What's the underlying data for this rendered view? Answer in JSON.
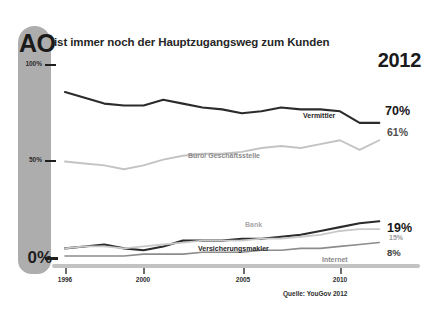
{
  "header": {
    "brand_mark": "AO",
    "headline": "ist immer noch der Hauptzugangsweg zum Kunden",
    "year": "2012"
  },
  "source": {
    "note": "Quelle: YouGov 2012"
  },
  "axis": {
    "y_labels": {
      "top": "100%",
      "mid": "50%",
      "bottom": "0%"
    },
    "x_labels": [
      "1996",
      "2000",
      "2005",
      "2010"
    ]
  },
  "callouts": {
    "vermittler_end": "70%",
    "buero_end": "61%",
    "versicherungsmakler_end": "19%",
    "bank_end": "15%",
    "internet_end": "8%"
  },
  "series_labels": {
    "vermittler": "Vermittler",
    "buero": "Büro/ Geschäftsstelle",
    "bank": "Bank",
    "versicherungsmakler": "Versicherungsmakler",
    "internet": "Internet"
  },
  "chart_data": {
    "type": "line",
    "title": "AO ist immer noch der Hauptzugangsweg zum Kunden 2012",
    "subtitle": "2012",
    "xlabel": "",
    "ylabel": "",
    "xlim": [
      1996,
      2012
    ],
    "ylim": [
      0,
      100
    ],
    "ytick_values": [
      0,
      50,
      100
    ],
    "ytick_labels": [
      "0%",
      "50%",
      "100%"
    ],
    "xtick_values": [
      1996,
      2000,
      2005,
      2010
    ],
    "xtick_labels": [
      "1996",
      "2000",
      "2005",
      "2010"
    ],
    "grid": false,
    "legend": "inline-labels",
    "annotation": "Quelle: YouGov 2012",
    "x": [
      1996,
      1997,
      1998,
      1999,
      2000,
      2001,
      2002,
      2003,
      2004,
      2005,
      2006,
      2007,
      2008,
      2009,
      2010,
      2011,
      2012
    ],
    "series": [
      {
        "name": "Vermittler",
        "color": "#2b2b2b",
        "end_label": "70%",
        "values": [
          86,
          83,
          80,
          79,
          79,
          82,
          80,
          78,
          77,
          75,
          76,
          78,
          77,
          77,
          76,
          70,
          70
        ]
      },
      {
        "name": "Büro/ Geschäftsstelle",
        "color": "#c3c3c3",
        "end_label": "61%",
        "values": [
          50,
          49,
          48,
          46,
          48,
          51,
          53,
          54,
          54,
          55,
          57,
          58,
          57,
          59,
          61,
          56,
          61
        ]
      },
      {
        "name": "Versicherungsmakler",
        "color": "#2b2b2b",
        "end_label": "19%",
        "values": [
          5,
          6,
          7,
          5,
          4,
          6,
          9,
          9,
          9,
          10,
          10,
          11,
          12,
          14,
          16,
          18,
          19
        ]
      },
      {
        "name": "Bank",
        "color": "#c9c9c9",
        "end_label": "15%",
        "values": [
          5,
          6,
          6,
          5,
          6,
          7,
          8,
          9,
          9,
          9,
          10,
          10,
          11,
          12,
          14,
          15,
          15
        ]
      },
      {
        "name": "Internet",
        "color": "#8c8c8c",
        "end_label": "8%",
        "values": [
          1,
          1,
          1,
          1,
          2,
          2,
          2,
          3,
          3,
          3,
          4,
          4,
          5,
          5,
          6,
          7,
          8
        ]
      }
    ]
  }
}
